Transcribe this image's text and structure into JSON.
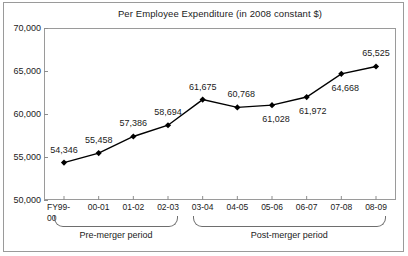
{
  "chart_data": {
    "type": "line",
    "title": "Per Employee Expenditure (in 2008 constant $)",
    "xlabel": "",
    "ylabel": "",
    "ylim": [
      50000,
      70000
    ],
    "ytick_values": [
      70000,
      65000,
      60000,
      55000,
      50000
    ],
    "ytick_labels": [
      "70,000",
      "65,000",
      "60,000",
      "55,000",
      "50,000"
    ],
    "grid": false,
    "legend": "none",
    "categories": [
      "FY99-\n00",
      "00-01",
      "01-02",
      "02-03",
      "03-04",
      "04-05",
      "05-06",
      "06-07",
      "07-08",
      "08-09"
    ],
    "category_labels_flat": [
      "FY99-00",
      "00-01",
      "01-02",
      "02-03",
      "03-04",
      "04-05",
      "05-06",
      "06-07",
      "07-08",
      "08-09"
    ],
    "values": [
      54346,
      55458,
      57386,
      58694,
      61675,
      60768,
      61028,
      61972,
      64668,
      65525
    ],
    "value_labels": [
      "54,346",
      "55,458",
      "57,386",
      "58,694",
      "61,675",
      "60,768",
      "61,028",
      "61,972",
      "64,668",
      "65,525"
    ],
    "marker": "diamond",
    "line_color": "#000000",
    "marker_color": "#000000",
    "annotations": [
      {
        "text": "Pre-merger period",
        "covers": [
          "FY99-00",
          "00-01",
          "01-02",
          "02-03"
        ]
      },
      {
        "text": "Post-merger period",
        "covers": [
          "03-04",
          "04-05",
          "05-06",
          "06-07",
          "07-08",
          "08-09"
        ]
      }
    ]
  },
  "groups": {
    "pre": {
      "label": "Pre-merger period"
    },
    "post": {
      "label": "Post-merger period"
    }
  }
}
